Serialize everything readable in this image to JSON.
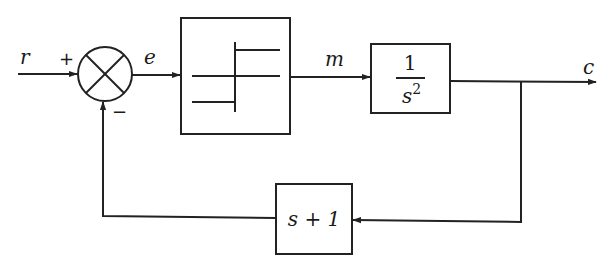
{
  "diagram": {
    "type": "feedback-control-block-diagram",
    "signals": {
      "input": "r",
      "error": "e",
      "manipulated": "m",
      "output": "c"
    },
    "summing_junction": {
      "plus_sign": "+",
      "minus_sign": "−"
    },
    "blocks": {
      "nonlinear": {
        "description": "relay with dead zone and hysteresis"
      },
      "plant": {
        "numerator": "1",
        "denominator_base": "s",
        "denominator_exponent": "2"
      },
      "feedback": {
        "label": "s + 1"
      }
    },
    "colors": {
      "line": "#222222",
      "background": "#ffffff"
    }
  }
}
